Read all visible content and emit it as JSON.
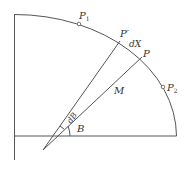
{
  "diagram": {
    "type": "meridian-arc-element",
    "colors": {
      "line": "#555555",
      "text": "#333333",
      "background": "#ffffff"
    },
    "labels": {
      "p1": "P",
      "p1_sub": "1",
      "p2": "P",
      "p2_sub": "2",
      "p_prime": "P′",
      "p": "P",
      "dx": "dX",
      "m": "M",
      "db": "dB",
      "b": "B"
    }
  }
}
